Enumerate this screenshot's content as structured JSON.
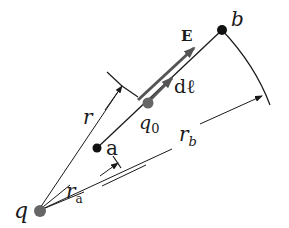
{
  "diagram": {
    "colors": {
      "line": "#1a1a1a",
      "field_arrow": "#555555",
      "charge_gray": "#666666",
      "point_black": "#111111",
      "background": "#ffffff"
    },
    "labels": {
      "q": "q",
      "a": "a",
      "b": "b",
      "q0": "q",
      "q0_subscript": "0",
      "r": "r",
      "ra": "r",
      "ra_subscript": "a",
      "rb": "r",
      "rb_subscript": "b",
      "E": "E",
      "dl": "dℓ"
    },
    "points": {
      "q": {
        "x": 38,
        "y": 211
      },
      "a": {
        "x": 97,
        "y": 148
      },
      "q0": {
        "x": 148,
        "y": 103
      },
      "b": {
        "x": 222,
        "y": 30
      }
    }
  }
}
